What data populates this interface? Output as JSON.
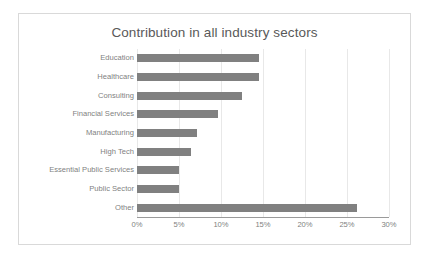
{
  "chart_data": {
    "type": "bar",
    "orientation": "horizontal",
    "title": "Contribution in all industry sectors",
    "xlabel": "",
    "ylabel": "",
    "categories": [
      "Education",
      "Healthcare",
      "Consulting",
      "Financial Services",
      "Manufacturing",
      "High Tech",
      "Essential Public Services",
      "Public Sector",
      "Other"
    ],
    "values": [
      14.5,
      14.5,
      12.5,
      9.7,
      7.2,
      6.4,
      5.0,
      5.0,
      26.2
    ],
    "value_suffix": "%",
    "xlim": [
      0,
      30
    ],
    "xticks": [
      0,
      5,
      10,
      15,
      20,
      25,
      30
    ],
    "xtick_labels": [
      "0%",
      "5%",
      "10%",
      "15%",
      "20%",
      "25%",
      "30%"
    ],
    "grid": true,
    "grid_axis": "x",
    "legend": false,
    "bar_color": "#808080",
    "gridline_color": "#e8e8e8",
    "axis_color": "#9a9a9a",
    "text_color": "#7f7f7f",
    "title_color": "#595959",
    "frame_border_color": "#d9d9d9",
    "background_color": "#ffffff"
  }
}
